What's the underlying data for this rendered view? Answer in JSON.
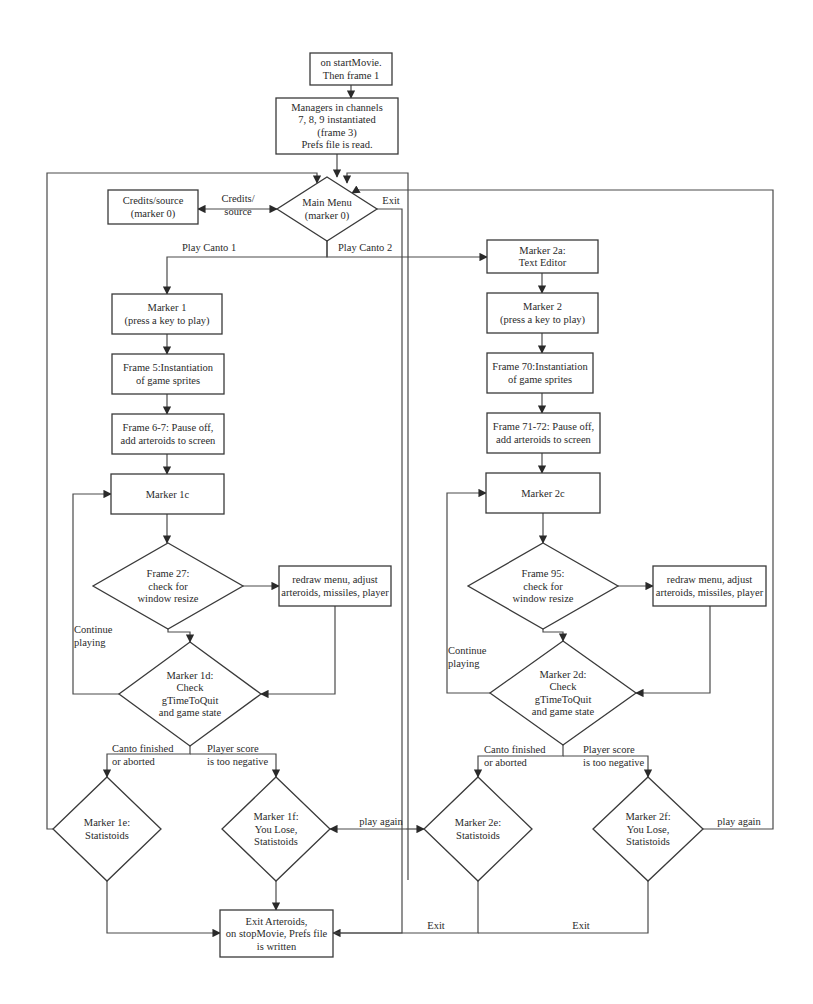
{
  "diagram": {
    "type": "flowchart",
    "colors": {
      "stroke": "#3a3a3a",
      "text": "#2a2a2a",
      "background": "#ffffff"
    },
    "nodes": [
      {
        "id": "start",
        "shape": "rect",
        "x": 310,
        "y": 53,
        "w": 82,
        "h": 32,
        "lines": [
          "on startMovie.",
          "Then frame 1"
        ]
      },
      {
        "id": "managers",
        "shape": "rect",
        "x": 276,
        "y": 98,
        "w": 122,
        "h": 56,
        "lines": [
          "Managers in channels",
          "7, 8, 9 instantiated",
          "(frame 3)",
          "Prefs file is read."
        ]
      },
      {
        "id": "main_menu",
        "shape": "diamond",
        "cx": 327,
        "cy": 209,
        "hw": 50,
        "hh": 32,
        "lines": [
          "Main Menu",
          "(marker 0)"
        ]
      },
      {
        "id": "credits",
        "shape": "rect",
        "x": 108,
        "y": 190,
        "w": 90,
        "h": 34,
        "lines": [
          "Credits/source",
          "(marker 0)"
        ]
      },
      {
        "id": "marker1",
        "shape": "rect",
        "x": 112,
        "y": 294,
        "w": 110,
        "h": 40,
        "lines": [
          "Marker 1",
          "(press a key to play)"
        ]
      },
      {
        "id": "frame5",
        "shape": "rect",
        "x": 112,
        "y": 354,
        "w": 112,
        "h": 40,
        "lines": [
          "Frame 5:Instantiation",
          "of game sprites"
        ]
      },
      {
        "id": "frame67",
        "shape": "rect",
        "x": 112,
        "y": 414,
        "w": 112,
        "h": 40,
        "lines": [
          "Frame 6-7: Pause off,",
          "add arteroids to screen"
        ]
      },
      {
        "id": "marker1c",
        "shape": "rect",
        "x": 111,
        "y": 474,
        "w": 113,
        "h": 40,
        "lines": [
          "Marker 1c"
        ]
      },
      {
        "id": "frame27",
        "shape": "diamond",
        "cx": 168,
        "cy": 586,
        "hw": 75,
        "hh": 43,
        "lines": [
          "Frame 27:",
          "check for",
          "window resize"
        ]
      },
      {
        "id": "redraw1",
        "shape": "rect",
        "x": 279,
        "y": 566,
        "w": 112,
        "h": 40,
        "lines": [
          "redraw menu, adjust",
          "arteroids, missiles, player"
        ]
      },
      {
        "id": "marker1d",
        "shape": "diamond",
        "cx": 190,
        "cy": 694,
        "hw": 71,
        "hh": 52,
        "lines": [
          "Marker 1d:",
          "Check",
          "gTimeToQuit",
          "and game state"
        ]
      },
      {
        "id": "marker1e",
        "shape": "diamond",
        "cx": 107,
        "cy": 829,
        "hw": 54,
        "hh": 52,
        "lines": [
          "Marker 1e:",
          "Statistoids"
        ]
      },
      {
        "id": "marker1f",
        "shape": "diamond",
        "cx": 276,
        "cy": 829,
        "hw": 54,
        "hh": 52,
        "lines": [
          "Marker 1f:",
          "You Lose,",
          "Statistoids"
        ]
      },
      {
        "id": "exit",
        "shape": "rect",
        "x": 220,
        "y": 910,
        "w": 113,
        "h": 47,
        "lines": [
          "Exit Arteroids,",
          "on stopMovie, Prefs file",
          "is written"
        ]
      },
      {
        "id": "marker2a",
        "shape": "rect",
        "x": 487,
        "y": 240,
        "w": 111,
        "h": 33,
        "lines": [
          "Marker 2a:",
          "Text Editor"
        ]
      },
      {
        "id": "marker2",
        "shape": "rect",
        "x": 487,
        "y": 293,
        "w": 111,
        "h": 40,
        "lines": [
          "Marker 2",
          "(press a key to play)"
        ]
      },
      {
        "id": "frame70",
        "shape": "rect",
        "x": 487,
        "y": 353,
        "w": 106,
        "h": 40,
        "lines": [
          "Frame 70:Instantiation",
          "of game sprites"
        ]
      },
      {
        "id": "frame7172",
        "shape": "rect",
        "x": 487,
        "y": 413,
        "w": 113,
        "h": 40,
        "lines": [
          "Frame 71-72: Pause off,",
          "add arteroids to screen"
        ]
      },
      {
        "id": "marker2c",
        "shape": "rect",
        "x": 486,
        "y": 473,
        "w": 114,
        "h": 40,
        "lines": [
          "Marker 2c"
        ]
      },
      {
        "id": "frame95",
        "shape": "diamond",
        "cx": 543,
        "cy": 586,
        "hw": 75,
        "hh": 43,
        "lines": [
          "Frame 95:",
          "check for",
          "window resize"
        ]
      },
      {
        "id": "redraw2",
        "shape": "rect",
        "x": 653,
        "y": 566,
        "w": 113,
        "h": 40,
        "lines": [
          "redraw menu, adjust",
          "arteroids, missiles, player"
        ]
      },
      {
        "id": "marker2d",
        "shape": "diamond",
        "cx": 563,
        "cy": 693,
        "hw": 73,
        "hh": 52,
        "lines": [
          "Marker 2d:",
          "Check",
          "gTimeToQuit",
          "and game state"
        ]
      },
      {
        "id": "marker2e",
        "shape": "diamond",
        "cx": 478,
        "cy": 829,
        "hw": 54,
        "hh": 52,
        "lines": [
          "Marker 2e:",
          "Statistoids"
        ]
      },
      {
        "id": "marker2f",
        "shape": "diamond",
        "cx": 648,
        "cy": 829,
        "hw": 55,
        "hh": 52,
        "lines": [
          "Marker 2f:",
          "You Lose,",
          "Statistoids"
        ]
      }
    ],
    "edges": [
      {
        "id": "e_start_managers",
        "points": [
          [
            351,
            85
          ],
          [
            351,
            98
          ]
        ],
        "arrow": "end"
      },
      {
        "id": "e_managers_menu",
        "points": [
          [
            337,
            154
          ],
          [
            337,
            177
          ]
        ],
        "arrow": "end"
      },
      {
        "id": "e_menu_credits",
        "points": [
          [
            277,
            209
          ],
          [
            198,
            209
          ]
        ],
        "arrow": "both"
      },
      {
        "id": "e_menu_canto1",
        "points": [
          [
            327,
            241
          ],
          [
            327,
            257
          ],
          [
            167,
            257
          ],
          [
            167,
            294
          ]
        ],
        "arrow": "end"
      },
      {
        "id": "e_menu_canto2",
        "points": [
          [
            327,
            241
          ],
          [
            327,
            257
          ],
          [
            487,
            257
          ]
        ],
        "arrow": "end"
      },
      {
        "id": "e_m1_f5",
        "points": [
          [
            167,
            334
          ],
          [
            167,
            354
          ]
        ],
        "arrow": "end"
      },
      {
        "id": "e_f5_f67",
        "points": [
          [
            167,
            394
          ],
          [
            167,
            414
          ]
        ],
        "arrow": "end"
      },
      {
        "id": "e_f67_m1c",
        "points": [
          [
            167,
            454
          ],
          [
            167,
            474
          ]
        ],
        "arrow": "end"
      },
      {
        "id": "e_m1c_f27",
        "points": [
          [
            167,
            514
          ],
          [
            167,
            543
          ]
        ],
        "arrow": "end"
      },
      {
        "id": "e_f27_redraw1",
        "points": [
          [
            243,
            586
          ],
          [
            279,
            586
          ]
        ],
        "arrow": "end"
      },
      {
        "id": "e_f27_m1d",
        "points": [
          [
            168,
            629
          ],
          [
            168,
            632
          ],
          [
            190,
            632
          ],
          [
            190,
            642
          ]
        ],
        "arrow": "end"
      },
      {
        "id": "e_redraw1_m1d",
        "points": [
          [
            335,
            606
          ],
          [
            335,
            694
          ],
          [
            261,
            694
          ]
        ],
        "arrow": "end"
      },
      {
        "id": "e_m1d_loop",
        "points": [
          [
            119,
            694
          ],
          [
            73,
            694
          ],
          [
            73,
            494
          ],
          [
            111,
            494
          ]
        ],
        "arrow": "end"
      },
      {
        "id": "e_m1d_split",
        "points": [
          [
            190,
            746
          ],
          [
            190,
            754
          ],
          [
            107,
            754
          ],
          [
            107,
            777
          ]
        ],
        "arrow": "end"
      },
      {
        "id": "e_m1d_split_r",
        "points": [
          [
            190,
            754
          ],
          [
            276,
            754
          ],
          [
            276,
            777
          ]
        ],
        "arrow": "end"
      },
      {
        "id": "e_m1e_top",
        "points": [
          [
            53,
            829
          ],
          [
            47,
            829
          ],
          [
            47,
            173
          ],
          [
            317,
            173
          ],
          [
            317,
            183
          ]
        ],
        "arrow": "end"
      },
      {
        "id": "e_m1e_exit",
        "points": [
          [
            107,
            881
          ],
          [
            107,
            933
          ],
          [
            220,
            933
          ]
        ],
        "arrow": "end"
      },
      {
        "id": "e_m1f_exit",
        "points": [
          [
            276,
            881
          ],
          [
            276,
            910
          ]
        ],
        "arrow": "end"
      },
      {
        "id": "e_m1f_playagain",
        "points": [
          [
            406,
            829
          ],
          [
            330,
            829
          ]
        ],
        "arrow": "end"
      },
      {
        "id": "e_m2e_playagain",
        "points": [
          [
            406,
            829
          ],
          [
            424,
            829
          ]
        ],
        "arrow": "end"
      },
      {
        "id": "e_menu_exit",
        "points": [
          [
            367,
            209
          ],
          [
            402,
            209
          ],
          [
            402,
            933
          ],
          [
            333,
            933
          ]
        ],
        "arrow": "end"
      },
      {
        "id": "e_loop1_top",
        "points": [
          [
            408,
            880
          ],
          [
            408,
            173
          ],
          [
            347,
            173
          ],
          [
            347,
            183
          ]
        ],
        "arrow": "end"
      },
      {
        "id": "e_m2a_m2",
        "points": [
          [
            542,
            273
          ],
          [
            542,
            293
          ]
        ],
        "arrow": "end"
      },
      {
        "id": "e_m2_f70",
        "points": [
          [
            542,
            333
          ],
          [
            542,
            353
          ]
        ],
        "arrow": "end"
      },
      {
        "id": "e_f70_f7172",
        "points": [
          [
            542,
            393
          ],
          [
            542,
            413
          ]
        ],
        "arrow": "end"
      },
      {
        "id": "e_f7172_m2c",
        "points": [
          [
            542,
            453
          ],
          [
            542,
            473
          ]
        ],
        "arrow": "end"
      },
      {
        "id": "e_m2c_f95",
        "points": [
          [
            543,
            513
          ],
          [
            543,
            543
          ]
        ],
        "arrow": "end"
      },
      {
        "id": "e_f95_redraw2",
        "points": [
          [
            618,
            586
          ],
          [
            653,
            586
          ]
        ],
        "arrow": "end"
      },
      {
        "id": "e_f95_m2d",
        "points": [
          [
            543,
            629
          ],
          [
            543,
            632
          ],
          [
            563,
            632
          ],
          [
            563,
            641
          ]
        ],
        "arrow": "end"
      },
      {
        "id": "e_redraw2_m2d",
        "points": [
          [
            710,
            606
          ],
          [
            710,
            693
          ],
          [
            636,
            693
          ]
        ],
        "arrow": "end"
      },
      {
        "id": "e_m2d_loop",
        "points": [
          [
            490,
            693
          ],
          [
            447,
            693
          ],
          [
            447,
            493
          ],
          [
            486,
            493
          ]
        ],
        "arrow": "end"
      },
      {
        "id": "e_m2d_split",
        "points": [
          [
            563,
            745
          ],
          [
            563,
            756
          ],
          [
            478,
            756
          ],
          [
            478,
            777
          ]
        ],
        "arrow": "end"
      },
      {
        "id": "e_m2d_split_r",
        "points": [
          [
            563,
            756
          ],
          [
            648,
            756
          ],
          [
            648,
            777
          ]
        ],
        "arrow": "end"
      },
      {
        "id": "e_m2e_exit",
        "points": [
          [
            478,
            881
          ],
          [
            478,
            933
          ],
          [
            333,
            933
          ]
        ],
        "arrow": "none"
      },
      {
        "id": "e_m2f_exit",
        "points": [
          [
            648,
            881
          ],
          [
            648,
            933
          ],
          [
            478,
            933
          ]
        ],
        "arrow": "none"
      },
      {
        "id": "e_m2f_playagain",
        "points": [
          [
            703,
            829
          ],
          [
            773,
            829
          ],
          [
            773,
            190
          ],
          [
            357,
            190
          ],
          [
            352,
            193
          ]
        ],
        "arrow": "end"
      }
    ],
    "edge_labels": [
      {
        "id": "lbl_credits",
        "x": 238,
        "y": 202,
        "lines": [
          "Credits/",
          "source"
        ]
      },
      {
        "id": "lbl_exit_menu",
        "x": 391,
        "y": 204,
        "lines": [
          "Exit"
        ]
      },
      {
        "id": "lbl_play1",
        "x": 182,
        "y": 251,
        "lines": [
          "Play Canto 1"
        ],
        "anchor": "start"
      },
      {
        "id": "lbl_play2",
        "x": 338,
        "y": 251,
        "lines": [
          "Play Canto 2"
        ],
        "anchor": "start"
      },
      {
        "id": "lbl_continue1",
        "x": 74,
        "y": 633,
        "lines": [
          "Continue",
          "playing"
        ],
        "anchor": "start"
      },
      {
        "id": "lbl_canto_fin1",
        "x": 112,
        "y": 752,
        "lines": [
          "Canto finished",
          "or aborted"
        ],
        "anchor": "start"
      },
      {
        "id": "lbl_score1",
        "x": 207,
        "y": 752,
        "lines": [
          "Player score",
          "is too negative"
        ],
        "anchor": "start"
      },
      {
        "id": "lbl_playagain1",
        "x": 381,
        "y": 825,
        "lines": [
          "play again"
        ]
      },
      {
        "id": "lbl_continue2",
        "x": 448,
        "y": 654,
        "lines": [
          "Continue",
          "playing"
        ],
        "anchor": "start"
      },
      {
        "id": "lbl_canto_fin2",
        "x": 484,
        "y": 753,
        "lines": [
          "Canto finished",
          "or aborted"
        ],
        "anchor": "start"
      },
      {
        "id": "lbl_score2",
        "x": 583,
        "y": 753,
        "lines": [
          "Player score",
          "is too negative"
        ],
        "anchor": "start"
      },
      {
        "id": "lbl_playagain2",
        "x": 739,
        "y": 825,
        "lines": [
          "play again"
        ]
      },
      {
        "id": "lbl_exit2e",
        "x": 436,
        "y": 929,
        "lines": [
          "Exit"
        ]
      },
      {
        "id": "lbl_exit2f",
        "x": 581,
        "y": 929,
        "lines": [
          "Exit"
        ]
      }
    ]
  }
}
